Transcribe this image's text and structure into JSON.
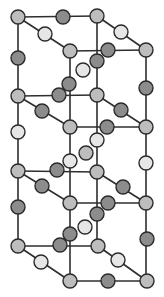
{
  "diagram": {
    "title": "Crystal lattice structure",
    "atom_radius": 7,
    "colors": {
      "gray": "#bdbdbd",
      "dark": "#8c8c8c",
      "light": "#e6e6e6",
      "bond": "#2e2e2e",
      "outline": "#2a2a2a"
    },
    "atoms": [
      {
        "id": "a1",
        "x": 18,
        "y": 17,
        "type": "gray"
      },
      {
        "id": "a2",
        "x": 63,
        "y": 17,
        "type": "dark"
      },
      {
        "id": "a3",
        "x": 97,
        "y": 16,
        "type": "gray"
      },
      {
        "id": "a4",
        "x": 45,
        "y": 34,
        "type": "light"
      },
      {
        "id": "a5",
        "x": 121,
        "y": 32,
        "type": "light"
      },
      {
        "id": "a6",
        "x": 70,
        "y": 51,
        "type": "gray"
      },
      {
        "id": "a7",
        "x": 108,
        "y": 50,
        "type": "dark"
      },
      {
        "id": "a8",
        "x": 146,
        "y": 50,
        "type": "gray"
      },
      {
        "id": "a9",
        "x": 18,
        "y": 58,
        "type": "dark"
      },
      {
        "id": "a10",
        "x": 97,
        "y": 61,
        "type": "dark"
      },
      {
        "id": "a11",
        "x": 83,
        "y": 70,
        "type": "light"
      },
      {
        "id": "a12",
        "x": 69,
        "y": 84,
        "type": "dark"
      },
      {
        "id": "a13",
        "x": 146,
        "y": 88,
        "type": "dark"
      },
      {
        "id": "a14",
        "x": 18,
        "y": 96,
        "type": "gray"
      },
      {
        "id": "a15",
        "x": 59,
        "y": 95,
        "type": "dark"
      },
      {
        "id": "a16",
        "x": 97,
        "y": 95,
        "type": "gray"
      },
      {
        "id": "a17",
        "x": 42,
        "y": 111,
        "type": "dark"
      },
      {
        "id": "a18",
        "x": 121,
        "y": 110,
        "type": "dark"
      },
      {
        "id": "a19",
        "x": 70,
        "y": 127,
        "type": "gray"
      },
      {
        "id": "a20",
        "x": 107,
        "y": 127,
        "type": "dark"
      },
      {
        "id": "a21",
        "x": 146,
        "y": 127,
        "type": "gray"
      },
      {
        "id": "a22",
        "x": 18,
        "y": 132,
        "type": "light"
      },
      {
        "id": "a23",
        "x": 97,
        "y": 140,
        "type": "light"
      },
      {
        "id": "a24",
        "x": 86,
        "y": 153,
        "type": "gray"
      },
      {
        "id": "a25",
        "x": 70,
        "y": 161,
        "type": "light"
      },
      {
        "id": "a26",
        "x": 146,
        "y": 163,
        "type": "light"
      },
      {
        "id": "a27",
        "x": 18,
        "y": 171,
        "type": "gray"
      },
      {
        "id": "a28",
        "x": 57,
        "y": 170,
        "type": "dark"
      },
      {
        "id": "a29",
        "x": 97,
        "y": 172,
        "type": "gray"
      },
      {
        "id": "a30",
        "x": 42,
        "y": 186,
        "type": "dark"
      },
      {
        "id": "a31",
        "x": 123,
        "y": 187,
        "type": "dark"
      },
      {
        "id": "a32",
        "x": 70,
        "y": 203,
        "type": "gray"
      },
      {
        "id": "a33",
        "x": 108,
        "y": 203,
        "type": "dark"
      },
      {
        "id": "a34",
        "x": 146,
        "y": 203,
        "type": "gray"
      },
      {
        "id": "a35",
        "x": 18,
        "y": 207,
        "type": "dark"
      },
      {
        "id": "a36",
        "x": 97,
        "y": 214,
        "type": "dark"
      },
      {
        "id": "a37",
        "x": 85,
        "y": 227,
        "type": "light"
      },
      {
        "id": "a38",
        "x": 70,
        "y": 234,
        "type": "dark"
      },
      {
        "id": "a39",
        "x": 147,
        "y": 239,
        "type": "dark"
      },
      {
        "id": "a40",
        "x": 18,
        "y": 246,
        "type": "gray"
      },
      {
        "id": "a41",
        "x": 60,
        "y": 245,
        "type": "dark"
      },
      {
        "id": "a42",
        "x": 98,
        "y": 246,
        "type": "gray"
      },
      {
        "id": "a43",
        "x": 41,
        "y": 262,
        "type": "light"
      },
      {
        "id": "a44",
        "x": 118,
        "y": 260,
        "type": "light"
      },
      {
        "id": "a45",
        "x": 70,
        "y": 281,
        "type": "gray"
      },
      {
        "id": "a46",
        "x": 108,
        "y": 281,
        "type": "dark"
      },
      {
        "id": "a47",
        "x": 147,
        "y": 281,
        "type": "gray"
      }
    ],
    "bonds": [
      [
        18,
        17,
        97,
        16
      ],
      [
        18,
        17,
        70,
        51
      ],
      [
        97,
        16,
        146,
        50
      ],
      [
        70,
        51,
        146,
        50
      ],
      [
        18,
        17,
        18,
        246
      ],
      [
        146,
        50,
        146,
        281
      ],
      [
        70,
        51,
        70,
        281
      ],
      [
        97,
        16,
        97,
        246
      ],
      [
        18,
        96,
        97,
        95
      ],
      [
        18,
        96,
        70,
        127
      ],
      [
        97,
        95,
        146,
        127
      ],
      [
        70,
        127,
        146,
        127
      ],
      [
        18,
        171,
        97,
        172
      ],
      [
        18,
        171,
        70,
        203
      ],
      [
        97,
        172,
        146,
        203
      ],
      [
        70,
        203,
        146,
        203
      ],
      [
        18,
        246,
        98,
        246
      ],
      [
        18,
        246,
        70,
        281
      ],
      [
        98,
        246,
        147,
        281
      ],
      [
        70,
        281,
        147,
        281
      ]
    ]
  }
}
